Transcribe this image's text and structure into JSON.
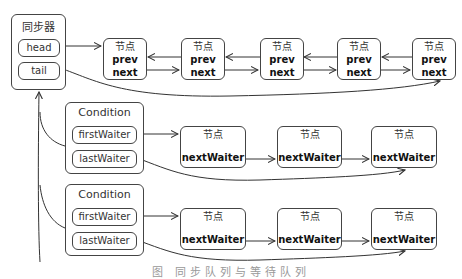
{
  "synchronizer": {
    "title": "同步器",
    "head_label": "head",
    "tail_label": "tail"
  },
  "sync_queue": {
    "nodes": [
      {
        "header": "节点",
        "prev": "prev",
        "next": "next"
      },
      {
        "header": "节点",
        "prev": "prev",
        "next": "next"
      },
      {
        "header": "节点",
        "prev": "prev",
        "next": "next"
      },
      {
        "header": "节点",
        "prev": "prev",
        "next": "next"
      },
      {
        "header": "节点",
        "prev": "prev",
        "next": "next"
      }
    ]
  },
  "conditions": [
    {
      "title": "Condition",
      "first_label": "firstWaiter",
      "last_label": "lastWaiter",
      "nodes": [
        {
          "header": "节点",
          "field": "nextWaiter"
        },
        {
          "header": "节点",
          "field": "nextWaiter"
        },
        {
          "header": "节点",
          "field": "nextWaiter"
        }
      ]
    },
    {
      "title": "Condition",
      "first_label": "firstWaiter",
      "last_label": "lastWaiter",
      "nodes": [
        {
          "header": "节点",
          "field": "nextWaiter"
        },
        {
          "header": "节点",
          "field": "nextWaiter"
        },
        {
          "header": "节点",
          "field": "nextWaiter"
        }
      ]
    }
  ],
  "caption": "图 同步队列与等待队列",
  "colors": {
    "stroke": "#444444",
    "background": "#ffffff"
  }
}
